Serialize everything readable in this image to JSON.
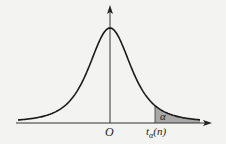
{
  "chart_data": {
    "type": "area",
    "title": "",
    "xlabel": "",
    "ylabel": "",
    "grid": false,
    "legend": null,
    "annotations": {
      "origin": "O",
      "critical_value": "tα(n)",
      "tail_area": "α"
    },
    "series": [
      {
        "name": "t density",
        "shape": "symmetric bell curve centered at O",
        "shaded_region": "right tail from tα(n) to +∞"
      }
    ]
  },
  "labels": {
    "origin": "O",
    "t_main": "t",
    "t_sub": "α",
    "t_arg": "(n)",
    "alpha": "α"
  },
  "colors": {
    "curve": "#1a1a1a",
    "axis": "#333333",
    "shade": "#a8a8a8"
  }
}
